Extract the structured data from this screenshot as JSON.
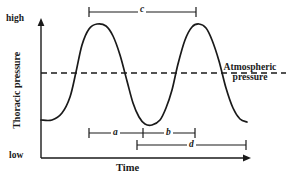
{
  "figure": {
    "background_color": "#ffffff",
    "line_color": "#1a1a1a"
  },
  "axes": {
    "y_label": "Thoracic pressure",
    "y_tick_high": "high",
    "y_tick_low": "low",
    "x_label": "Time"
  },
  "reference_line": {
    "label_line1": "Atmospheric",
    "label_line2": "pressure",
    "style": "dashed"
  },
  "interval_markers": [
    {
      "id": "c",
      "label": "c",
      "x_start": 89,
      "x_end": 196,
      "y": 12
    },
    {
      "id": "a",
      "label": "a",
      "x_start": 89,
      "x_end": 143,
      "y": 133
    },
    {
      "id": "b",
      "label": "b",
      "x_start": 143,
      "x_end": 195,
      "y": 133
    },
    {
      "id": "d",
      "label": "d",
      "x_start": 137,
      "x_end": 246,
      "y": 145
    }
  ],
  "chart_data": {
    "type": "line",
    "title": "",
    "xlabel": "Time",
    "ylabel": "Thoracic pressure",
    "xlim": [
      0,
      1
    ],
    "ylim": [
      "low",
      "high"
    ],
    "grid": false,
    "legend": null,
    "annotations": [
      {
        "text": "Atmospheric pressure",
        "type": "reference-line-label"
      },
      {
        "text": "c",
        "type": "interval",
        "meaning": "peak-to-peak interval"
      },
      {
        "text": "a",
        "type": "interval",
        "meaning": "first sub-interval"
      },
      {
        "text": "b",
        "type": "interval",
        "meaning": "second sub-interval"
      },
      {
        "text": "d",
        "type": "interval",
        "meaning": "trough-to-trough interval"
      }
    ],
    "reference_lines": [
      {
        "orientation": "horizontal",
        "label": "Atmospheric pressure",
        "style": "dashed",
        "y_pixel": 73
      }
    ],
    "series": [
      {
        "name": "Thoracic pressure",
        "points": [
          [
            41,
            120
          ],
          [
            52,
            120
          ],
          [
            62,
            113
          ],
          [
            70,
            97
          ],
          [
            76,
            72
          ],
          [
            82,
            45
          ],
          [
            89,
            29
          ],
          [
            97,
            24
          ],
          [
            106,
            26
          ],
          [
            113,
            36
          ],
          [
            120,
            55
          ],
          [
            127,
            81
          ],
          [
            133,
            103
          ],
          [
            139,
            117
          ],
          [
            145,
            124
          ],
          [
            152,
            125
          ],
          [
            160,
            120
          ],
          [
            166,
            108
          ],
          [
            172,
            90
          ],
          [
            178,
            64
          ],
          [
            185,
            40
          ],
          [
            192,
            27
          ],
          [
            199,
            24
          ],
          [
            206,
            28
          ],
          [
            212,
            40
          ],
          [
            219,
            61
          ],
          [
            226,
            88
          ],
          [
            233,
            108
          ],
          [
            240,
            119
          ],
          [
            247,
            122
          ]
        ]
      }
    ]
  }
}
